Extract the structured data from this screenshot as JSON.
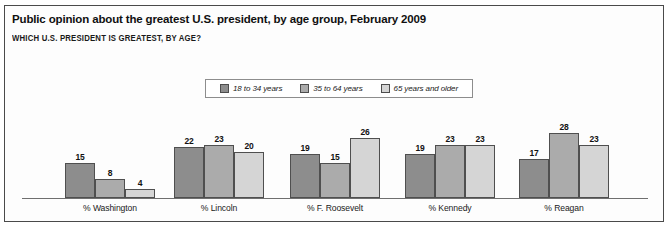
{
  "chart": {
    "title": "Public opinion about the greatest U.S. president, by age group, February 2009",
    "subtitle": "WHICH U.S. PRESIDENT IS GREATEST, BY AGE?"
  },
  "legend": {
    "items": [
      {
        "label": "18 to 34 years",
        "color": "#8d8d8d"
      },
      {
        "label": "35 to 64 years",
        "color": "#ababab"
      },
      {
        "label": "65 years and older",
        "color": "#d5d5d5"
      }
    ]
  },
  "chart_data": {
    "type": "bar",
    "title": "Public opinion about the greatest U.S. president, by age group, February 2009",
    "subtitle": "WHICH U.S. PRESIDENT IS GREATEST, BY AGE?",
    "xlabel": "",
    "ylabel": "",
    "ylim": [
      0,
      30
    ],
    "grid": false,
    "legend_position": "top-center",
    "categories": [
      "% Washington",
      "% Lincoln",
      "% F. Roosevelt",
      "% Kennedy",
      "% Reagan"
    ],
    "series": [
      {
        "name": "18 to 34 years",
        "color": "#8d8d8d",
        "values": [
          15,
          22,
          19,
          19,
          17
        ]
      },
      {
        "name": "35 to 64 years",
        "color": "#ababab",
        "values": [
          8,
          23,
          15,
          23,
          28
        ]
      },
      {
        "name": "65 years and older",
        "color": "#d5d5d5",
        "values": [
          4,
          20,
          26,
          23,
          23
        ]
      }
    ]
  }
}
